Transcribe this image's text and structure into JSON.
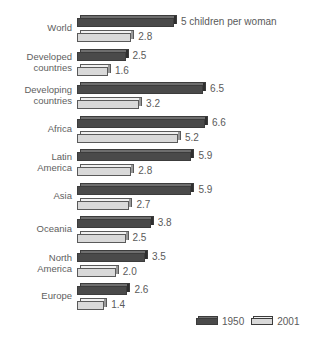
{
  "chart_data": {
    "type": "bar",
    "orientation": "horizontal",
    "title": "",
    "subtitle": "",
    "xlabel": "",
    "ylabel": "",
    "grid": false,
    "legend_position": "bottom-right",
    "xlim": [
      0,
      7
    ],
    "annotation": "5 children per woman",
    "categories": [
      "World",
      "Developed\ncountries",
      "Developing\ncountries",
      "Africa",
      "Latin\nAmerica",
      "Asia",
      "Oceania",
      "North\nAmerica",
      "Europe"
    ],
    "series": [
      {
        "name": "1950",
        "color": "#4a4a4a",
        "values": [
          5.0,
          2.5,
          6.5,
          6.6,
          5.9,
          5.9,
          3.8,
          3.5,
          2.6
        ],
        "labels": [
          "5 children per woman",
          "2.5",
          "6.5",
          "6.6",
          "5.9",
          "5.9",
          "3.8",
          "3.5",
          "2.6"
        ]
      },
      {
        "name": "2001",
        "color": "#d9d9d9",
        "values": [
          2.8,
          1.6,
          3.2,
          5.2,
          2.8,
          2.7,
          2.5,
          2.0,
          1.4
        ],
        "labels": [
          "2.8",
          "1.6",
          "3.2",
          "5.2",
          "2.8",
          "2.7",
          "2.5",
          "2.0",
          "1.4"
        ]
      }
    ]
  },
  "legend": {
    "items": [
      {
        "label": "1950"
      },
      {
        "label": "2001"
      }
    ]
  }
}
